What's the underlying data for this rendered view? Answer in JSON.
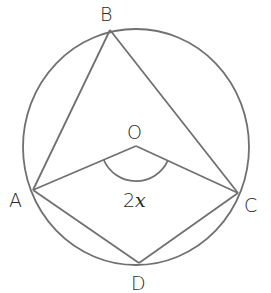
{
  "diagram": {
    "type": "circle-theorem",
    "stroke_color": "#707070",
    "text_color": "#2a2a2a",
    "circle": {
      "cx": 136,
      "cy": 147,
      "rx": 113,
      "ry": 118
    },
    "points": {
      "A": {
        "label": "A",
        "x": 33,
        "y": 190,
        "label_x": 9,
        "label_y": 207
      },
      "B": {
        "label": "B",
        "x": 110,
        "y": 30,
        "label_x": 100,
        "label_y": 21
      },
      "C": {
        "label": "C",
        "x": 238,
        "y": 193,
        "label_x": 244,
        "label_y": 212
      },
      "D": {
        "label": "D",
        "x": 139,
        "y": 263,
        "label_x": 131,
        "label_y": 290
      },
      "O": {
        "label": "O",
        "x": 136,
        "y": 146,
        "label_x": 127,
        "label_y": 139
      }
    },
    "segments": [
      "AB",
      "BC",
      "AO",
      "OC",
      "AD",
      "DC"
    ],
    "angle_marker": {
      "at": "O",
      "between": [
        "A",
        "C"
      ],
      "label_number": "2",
      "label_variable": "x"
    }
  }
}
